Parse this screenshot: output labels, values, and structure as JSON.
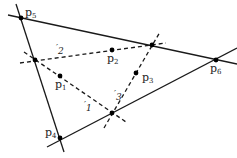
{
  "diagram": {
    "title": "",
    "colors": {
      "line": "#1a1a1a",
      "point": "#000000",
      "background": "#ffffff"
    },
    "solid_lines": [
      {
        "id": "top-line",
        "x1": 8,
        "y1": 15,
        "x2": 237,
        "y2": 64
      },
      {
        "id": "left-line",
        "x1": 16,
        "y1": 4,
        "x2": 64,
        "y2": 152
      },
      {
        "id": "bottom-line",
        "x1": 47,
        "y1": 147,
        "x2": 237,
        "y2": 48
      }
    ],
    "dashed_lines": [
      {
        "id": "l1",
        "x1": 24,
        "y1": 52,
        "x2": 126,
        "y2": 122
      },
      {
        "id": "l2",
        "x1": 20,
        "y1": 63,
        "x2": 166,
        "y2": 43
      },
      {
        "id": "l3",
        "x1": 104,
        "y1": 128,
        "x2": 160,
        "y2": 32
      }
    ],
    "vertices": [
      {
        "id": "p5",
        "x": 21,
        "y": 18
      },
      {
        "id": "v-l1-l2",
        "x": 35,
        "y": 60
      },
      {
        "id": "v-l2-l3",
        "x": 152,
        "y": 45
      },
      {
        "id": "p6",
        "x": 216,
        "y": 60
      },
      {
        "id": "v-l1-l3",
        "x": 112,
        "y": 113
      },
      {
        "id": "p4",
        "x": 60,
        "y": 138
      },
      {
        "id": "p1",
        "x": 60,
        "y": 76
      },
      {
        "id": "p2",
        "x": 112,
        "y": 50
      },
      {
        "id": "p3",
        "x": 136,
        "y": 73
      }
    ],
    "point_labels": [
      {
        "id": "p5",
        "base": "p",
        "sub": "5",
        "x": 25,
        "y": 16
      },
      {
        "id": "p2",
        "base": "p",
        "sub": "2",
        "x": 107,
        "y": 62
      },
      {
        "id": "p1",
        "base": "p",
        "sub": "1",
        "x": 55,
        "y": 88
      },
      {
        "id": "p3",
        "base": "p",
        "sub": "3",
        "x": 142,
        "y": 81
      },
      {
        "id": "p6",
        "base": "p",
        "sub": "6",
        "x": 210,
        "y": 72
      },
      {
        "id": "p4",
        "base": "p",
        "sub": "4",
        "x": 45,
        "y": 136
      }
    ],
    "line_labels": [
      {
        "id": "l2",
        "base": "′",
        "sub": "2",
        "x": 56,
        "y": 51
      },
      {
        "id": "l1",
        "base": "′",
        "sub": "1",
        "x": 84,
        "y": 108
      },
      {
        "id": "l3",
        "base": "′",
        "sub": "3",
        "x": 114,
        "y": 97
      }
    ]
  }
}
